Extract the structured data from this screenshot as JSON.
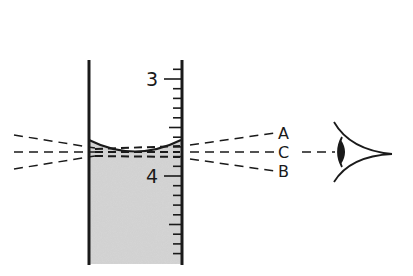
{
  "figure": {
    "type": "measuring-cylinder-meniscus-reading",
    "scale": {
      "labels": [
        {
          "text": "3",
          "y": 79
        },
        {
          "text": "4",
          "y": 176
        }
      ],
      "minor_divisions_per_unit": 10
    },
    "sight_lines": [
      {
        "label": "A",
        "description": "line of sight from above"
      },
      {
        "label": "C",
        "description": "line of sight level with meniscus"
      },
      {
        "label": "B",
        "description": "line of sight from below"
      }
    ],
    "eye": {
      "name": "observer-eye"
    },
    "colors": {
      "ink": "#1a1a1a",
      "liquid": "#d6d6d6",
      "background": "#ffffff"
    }
  }
}
